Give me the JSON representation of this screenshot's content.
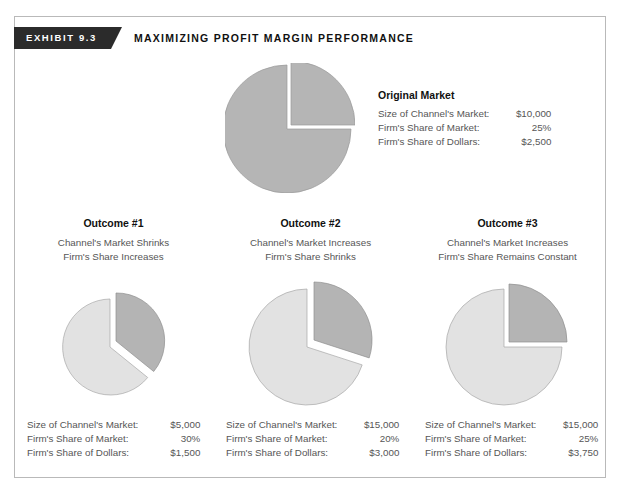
{
  "exhibit": {
    "tag": "EXHIBIT  9.3",
    "title": "MAXIMIZING PROFIT MARGIN PERFORMANCE"
  },
  "original": {
    "title": "Original Market",
    "stats": [
      {
        "label": "Size of Channel's Market:",
        "value": "$10,000"
      },
      {
        "label": "Firm's Share of Market:",
        "value": "25%"
      },
      {
        "label": "Firm's Share of Dollars:",
        "value": "$2,500"
      }
    ]
  },
  "outcomes": [
    {
      "heading": "Outcome #1",
      "sub_line1": "Channel's Market Shrinks",
      "sub_line2": "Firm's Share Increases",
      "stats": [
        {
          "label": "Size of Channel's Market:",
          "value": "$5,000"
        },
        {
          "label": "Firm's Share of Market:",
          "value": "30%"
        },
        {
          "label": "Firm's Share of Dollars:",
          "value": "$1,500"
        }
      ]
    },
    {
      "heading": "Outcome #2",
      "sub_line1": "Channel's Market Increases",
      "sub_line2": "Firm's Share Shrinks",
      "stats": [
        {
          "label": "Size of Channel's Market:",
          "value": "$15,000"
        },
        {
          "label": "Firm's Share of Market:",
          "value": "20%"
        },
        {
          "label": "Firm's Share of Dollars:",
          "value": "$3,000"
        }
      ]
    },
    {
      "heading": "Outcome #3",
      "sub_line1": "Channel's Market Increases",
      "sub_line2": "Firm's Share Remains Constant",
      "stats": [
        {
          "label": "Size of Channel's Market:",
          "value": "$15,000"
        },
        {
          "label": "Firm's Share of Market:",
          "value": "25%"
        },
        {
          "label": "Firm's Share of Dollars:",
          "value": "$3,750"
        }
      ]
    }
  ],
  "colors": {
    "banner": "#2b2b2b",
    "frame_border": "#b9b9b9",
    "pie_body_original": "#b5b5b5",
    "pie_slice_original": "#b5b5b5",
    "pie_body_outcome": "#e2e2e2",
    "pie_slice_outcome": "#b4b4b4",
    "pie_outline": "#8a8a8a",
    "text_body": "#565656",
    "text_heading": "#111111"
  },
  "chart_data": [
    {
      "type": "pie",
      "title": "Original Market",
      "labels": [
        "Firm's Share",
        "Rest of Channel's Market"
      ],
      "values": [
        25,
        75
      ],
      "units": "percent",
      "market_size": 10000,
      "firm_dollars": 2500,
      "exploded_slice": 0,
      "radius_px": 64
    },
    {
      "type": "pie",
      "title": "Outcome #1",
      "labels": [
        "Firm's Share",
        "Rest of Channel's Market"
      ],
      "values": [
        30,
        70
      ],
      "units": "percent",
      "market_size": 5000,
      "firm_dollars": 1500,
      "exploded_slice": 0,
      "radius_px": 48
    },
    {
      "type": "pie",
      "title": "Outcome #2",
      "labels": [
        "Firm's Share",
        "Rest of Channel's Market"
      ],
      "values": [
        20,
        80
      ],
      "units": "percent",
      "market_size": 15000,
      "firm_dollars": 3000,
      "exploded_slice": 0,
      "radius_px": 58
    },
    {
      "type": "pie",
      "title": "Outcome #3",
      "labels": [
        "Firm's Share",
        "Rest of Channel's Market"
      ],
      "values": [
        25,
        75
      ],
      "units": "percent",
      "market_size": 15000,
      "firm_dollars": 3750,
      "exploded_slice": 0,
      "radius_px": 58
    }
  ]
}
